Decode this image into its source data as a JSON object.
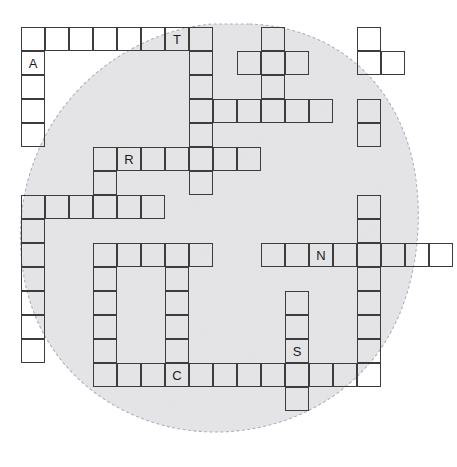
{
  "puzzle": {
    "title": "Crossword Grid",
    "cell_size": 24,
    "origin_x": 21,
    "origin_y": 27,
    "grid_stroke_color": "#3c3c3c",
    "letter_color": "#1a1a1a",
    "background_color": "#ffffff",
    "blob_fill_color": "#d9d9d9",
    "blob_outline_color": "#bdaec4",
    "letters": {
      "A": "A",
      "T": "T",
      "R": "R",
      "N": "N",
      "S": "S",
      "C": "C"
    },
    "entries": [
      {
        "name": "across-row0",
        "direction": "across",
        "row": 0,
        "col": 0,
        "length": 8,
        "cells": [
          {
            "col": 0,
            "letter": ""
          },
          {
            "col": 1,
            "letter": ""
          },
          {
            "col": 2,
            "letter": ""
          },
          {
            "col": 3,
            "letter": ""
          },
          {
            "col": 4,
            "letter": ""
          },
          {
            "col": 5,
            "letter": ""
          },
          {
            "col": 6,
            "letter": "T"
          },
          {
            "col": 7,
            "letter": ""
          }
        ]
      },
      {
        "name": "down-col0-top",
        "direction": "down",
        "row": 1,
        "col": 0,
        "length": 4,
        "cells": [
          {
            "row": 1,
            "letter": "A"
          },
          {
            "row": 2,
            "letter": ""
          },
          {
            "row": 3,
            "letter": ""
          },
          {
            "row": 4,
            "letter": ""
          }
        ]
      },
      {
        "name": "down-col7-upper",
        "direction": "down",
        "row": 1,
        "col": 7,
        "length": 6,
        "cells": [
          {
            "row": 1,
            "letter": ""
          },
          {
            "row": 2,
            "letter": ""
          },
          {
            "row": 3,
            "letter": ""
          },
          {
            "row": 4,
            "letter": ""
          },
          {
            "row": 5,
            "letter": ""
          },
          {
            "row": 6,
            "letter": ""
          }
        ]
      },
      {
        "name": "down-col10-upper",
        "direction": "down",
        "row": 0,
        "col": 10,
        "length": 4,
        "cells": [
          {
            "row": 0,
            "letter": ""
          },
          {
            "row": 1,
            "letter": ""
          },
          {
            "row": 2,
            "letter": ""
          },
          {
            "row": 3,
            "letter": ""
          }
        ]
      },
      {
        "name": "down-col14-upper",
        "direction": "down",
        "row": 0,
        "col": 14,
        "length": 2,
        "cells": [
          {
            "row": 0,
            "letter": ""
          },
          {
            "row": 1,
            "letter": ""
          }
        ]
      },
      {
        "name": "across-row1-right",
        "direction": "across",
        "row": 1,
        "col": 9,
        "length": 3,
        "cells": [
          {
            "col": 9,
            "letter": ""
          },
          {
            "col": 10,
            "letter": ""
          },
          {
            "col": 11,
            "letter": ""
          }
        ]
      },
      {
        "name": "across-row1-farright",
        "direction": "across",
        "row": 1,
        "col": 14,
        "length": 2,
        "cells": [
          {
            "col": 14,
            "letter": ""
          },
          {
            "col": 15,
            "letter": ""
          }
        ]
      },
      {
        "name": "across-row3-mid",
        "direction": "across",
        "row": 3,
        "col": 8,
        "length": 5,
        "cells": [
          {
            "col": 8,
            "letter": ""
          },
          {
            "col": 9,
            "letter": ""
          },
          {
            "col": 10,
            "letter": ""
          },
          {
            "col": 11,
            "letter": ""
          },
          {
            "col": 12,
            "letter": ""
          }
        ]
      },
      {
        "name": "down-col14-second",
        "direction": "down",
        "row": 3,
        "col": 14,
        "length": 2,
        "cells": [
          {
            "row": 3,
            "letter": ""
          },
          {
            "row": 4,
            "letter": ""
          }
        ]
      },
      {
        "name": "across-row5-r",
        "direction": "across",
        "row": 5,
        "col": 3,
        "length": 7,
        "cells": [
          {
            "col": 3,
            "letter": ""
          },
          {
            "col": 4,
            "letter": "R"
          },
          {
            "col": 5,
            "letter": ""
          },
          {
            "col": 6,
            "letter": ""
          },
          {
            "col": 7,
            "letter": ""
          },
          {
            "col": 8,
            "letter": ""
          },
          {
            "col": 9,
            "letter": ""
          }
        ]
      },
      {
        "name": "down-col3-mid",
        "direction": "down",
        "row": 6,
        "col": 3,
        "length": 2,
        "cells": [
          {
            "row": 6,
            "letter": ""
          },
          {
            "row": 7,
            "letter": ""
          }
        ]
      },
      {
        "name": "across-row7-left",
        "direction": "across",
        "row": 7,
        "col": 0,
        "length": 6,
        "cells": [
          {
            "col": 0,
            "letter": ""
          },
          {
            "col": 1,
            "letter": ""
          },
          {
            "col": 2,
            "letter": ""
          },
          {
            "col": 3,
            "letter": ""
          },
          {
            "col": 4,
            "letter": ""
          },
          {
            "col": 5,
            "letter": ""
          }
        ]
      },
      {
        "name": "down-col0-lower",
        "direction": "down",
        "row": 8,
        "col": 0,
        "length": 6,
        "cells": [
          {
            "row": 8,
            "letter": ""
          },
          {
            "row": 9,
            "letter": ""
          },
          {
            "row": 10,
            "letter": ""
          },
          {
            "row": 11,
            "letter": ""
          },
          {
            "row": 12,
            "letter": ""
          },
          {
            "row": 13,
            "letter": ""
          }
        ]
      },
      {
        "name": "across-row9-mid",
        "direction": "across",
        "row": 9,
        "col": 3,
        "length": 5,
        "cells": [
          {
            "col": 3,
            "letter": ""
          },
          {
            "col": 4,
            "letter": ""
          },
          {
            "col": 5,
            "letter": ""
          },
          {
            "col": 6,
            "letter": ""
          },
          {
            "col": 7,
            "letter": ""
          }
        ]
      },
      {
        "name": "down-col3-lower",
        "direction": "down",
        "row": 10,
        "col": 3,
        "length": 6,
        "cells": [
          {
            "row": 10,
            "letter": ""
          },
          {
            "row": 11,
            "letter": ""
          },
          {
            "row": 12,
            "letter": ""
          },
          {
            "row": 13,
            "letter": ""
          },
          {
            "row": 14,
            "letter": ""
          },
          {
            "row": 15,
            "letter": ""
          }
        ]
      },
      {
        "name": "down-col6-lower",
        "direction": "down",
        "row": 10,
        "col": 6,
        "length": 6,
        "cells": [
          {
            "row": 10,
            "letter": ""
          },
          {
            "row": 11,
            "letter": ""
          },
          {
            "row": 12,
            "letter": ""
          },
          {
            "row": 13,
            "letter": ""
          },
          {
            "row": 14,
            "letter": ""
          },
          {
            "row": 15,
            "letter": ""
          }
        ]
      },
      {
        "name": "across-row9-n",
        "direction": "across",
        "row": 9,
        "col": 10,
        "length": 8,
        "cells": [
          {
            "col": 10,
            "letter": ""
          },
          {
            "col": 11,
            "letter": ""
          },
          {
            "col": 12,
            "letter": "N"
          },
          {
            "col": 13,
            "letter": ""
          },
          {
            "col": 14,
            "letter": ""
          },
          {
            "col": 15,
            "letter": ""
          },
          {
            "col": 16,
            "letter": ""
          },
          {
            "col": 17,
            "letter": ""
          }
        ]
      },
      {
        "name": "down-col14-long",
        "direction": "down",
        "row": 7,
        "col": 14,
        "length": 9,
        "cells": [
          {
            "row": 7,
            "letter": ""
          },
          {
            "row": 8,
            "letter": ""
          },
          {
            "row": 9,
            "letter": ""
          },
          {
            "row": 10,
            "letter": ""
          },
          {
            "row": 11,
            "letter": ""
          },
          {
            "row": 12,
            "letter": ""
          },
          {
            "row": 13,
            "letter": ""
          },
          {
            "row": 14,
            "letter": ""
          },
          {
            "row": 15,
            "letter": ""
          }
        ]
      },
      {
        "name": "down-col11-s",
        "direction": "down",
        "row": 11,
        "col": 11,
        "length": 6,
        "cells": [
          {
            "row": 11,
            "letter": ""
          },
          {
            "row": 12,
            "letter": ""
          },
          {
            "row": 13,
            "letter": "S"
          },
          {
            "row": 14,
            "letter": ""
          },
          {
            "row": 15,
            "letter": ""
          },
          {
            "row": 16,
            "letter": ""
          }
        ]
      },
      {
        "name": "across-row14-c",
        "direction": "across",
        "row": 14,
        "col": 4,
        "length": 11,
        "cells": [
          {
            "col": 4,
            "letter": ""
          },
          {
            "col": 5,
            "letter": ""
          },
          {
            "col": 6,
            "letter": "C"
          },
          {
            "col": 7,
            "letter": ""
          },
          {
            "col": 8,
            "letter": ""
          },
          {
            "col": 9,
            "letter": ""
          },
          {
            "col": 10,
            "letter": ""
          },
          {
            "col": 11,
            "letter": ""
          },
          {
            "col": 12,
            "letter": ""
          },
          {
            "col": 13,
            "letter": ""
          },
          {
            "col": 14,
            "letter": ""
          }
        ]
      }
    ],
    "cells": [
      {
        "r": 0,
        "c": 0,
        "l": ""
      },
      {
        "r": 0,
        "c": 1,
        "l": ""
      },
      {
        "r": 0,
        "c": 2,
        "l": ""
      },
      {
        "r": 0,
        "c": 3,
        "l": ""
      },
      {
        "r": 0,
        "c": 4,
        "l": ""
      },
      {
        "r": 0,
        "c": 5,
        "l": ""
      },
      {
        "r": 0,
        "c": 6,
        "l": "T"
      },
      {
        "r": 0,
        "c": 7,
        "l": ""
      },
      {
        "r": 0,
        "c": 10,
        "l": ""
      },
      {
        "r": 0,
        "c": 14,
        "l": ""
      },
      {
        "r": 1,
        "c": 0,
        "l": "A"
      },
      {
        "r": 1,
        "c": 7,
        "l": ""
      },
      {
        "r": 1,
        "c": 9,
        "l": ""
      },
      {
        "r": 1,
        "c": 10,
        "l": ""
      },
      {
        "r": 1,
        "c": 11,
        "l": ""
      },
      {
        "r": 1,
        "c": 14,
        "l": ""
      },
      {
        "r": 1,
        "c": 15,
        "l": ""
      },
      {
        "r": 2,
        "c": 0,
        "l": ""
      },
      {
        "r": 2,
        "c": 7,
        "l": ""
      },
      {
        "r": 2,
        "c": 10,
        "l": ""
      },
      {
        "r": 3,
        "c": 0,
        "l": ""
      },
      {
        "r": 3,
        "c": 7,
        "l": ""
      },
      {
        "r": 3,
        "c": 8,
        "l": ""
      },
      {
        "r": 3,
        "c": 9,
        "l": ""
      },
      {
        "r": 3,
        "c": 10,
        "l": ""
      },
      {
        "r": 3,
        "c": 11,
        "l": ""
      },
      {
        "r": 3,
        "c": 12,
        "l": ""
      },
      {
        "r": 3,
        "c": 14,
        "l": ""
      },
      {
        "r": 4,
        "c": 0,
        "l": ""
      },
      {
        "r": 4,
        "c": 7,
        "l": ""
      },
      {
        "r": 4,
        "c": 14,
        "l": ""
      },
      {
        "r": 5,
        "c": 3,
        "l": ""
      },
      {
        "r": 5,
        "c": 4,
        "l": "R"
      },
      {
        "r": 5,
        "c": 5,
        "l": ""
      },
      {
        "r": 5,
        "c": 6,
        "l": ""
      },
      {
        "r": 5,
        "c": 7,
        "l": ""
      },
      {
        "r": 5,
        "c": 8,
        "l": ""
      },
      {
        "r": 5,
        "c": 9,
        "l": ""
      },
      {
        "r": 6,
        "c": 3,
        "l": ""
      },
      {
        "r": 6,
        "c": 7,
        "l": ""
      },
      {
        "r": 7,
        "c": 0,
        "l": ""
      },
      {
        "r": 7,
        "c": 1,
        "l": ""
      },
      {
        "r": 7,
        "c": 2,
        "l": ""
      },
      {
        "r": 7,
        "c": 3,
        "l": ""
      },
      {
        "r": 7,
        "c": 4,
        "l": ""
      },
      {
        "r": 7,
        "c": 5,
        "l": ""
      },
      {
        "r": 7,
        "c": 14,
        "l": ""
      },
      {
        "r": 8,
        "c": 0,
        "l": ""
      },
      {
        "r": 8,
        "c": 14,
        "l": ""
      },
      {
        "r": 9,
        "c": 0,
        "l": ""
      },
      {
        "r": 9,
        "c": 3,
        "l": ""
      },
      {
        "r": 9,
        "c": 4,
        "l": ""
      },
      {
        "r": 9,
        "c": 5,
        "l": ""
      },
      {
        "r": 9,
        "c": 6,
        "l": ""
      },
      {
        "r": 9,
        "c": 7,
        "l": ""
      },
      {
        "r": 9,
        "c": 10,
        "l": ""
      },
      {
        "r": 9,
        "c": 11,
        "l": ""
      },
      {
        "r": 9,
        "c": 12,
        "l": "N"
      },
      {
        "r": 9,
        "c": 13,
        "l": ""
      },
      {
        "r": 9,
        "c": 14,
        "l": ""
      },
      {
        "r": 9,
        "c": 15,
        "l": ""
      },
      {
        "r": 9,
        "c": 16,
        "l": ""
      },
      {
        "r": 9,
        "c": 17,
        "l": ""
      },
      {
        "r": 10,
        "c": 0,
        "l": ""
      },
      {
        "r": 10,
        "c": 3,
        "l": ""
      },
      {
        "r": 10,
        "c": 6,
        "l": ""
      },
      {
        "r": 10,
        "c": 14,
        "l": ""
      },
      {
        "r": 11,
        "c": 0,
        "l": ""
      },
      {
        "r": 11,
        "c": 3,
        "l": ""
      },
      {
        "r": 11,
        "c": 6,
        "l": ""
      },
      {
        "r": 11,
        "c": 11,
        "l": ""
      },
      {
        "r": 11,
        "c": 14,
        "l": ""
      },
      {
        "r": 12,
        "c": 0,
        "l": ""
      },
      {
        "r": 12,
        "c": 3,
        "l": ""
      },
      {
        "r": 12,
        "c": 6,
        "l": ""
      },
      {
        "r": 12,
        "c": 11,
        "l": ""
      },
      {
        "r": 12,
        "c": 14,
        "l": ""
      },
      {
        "r": 13,
        "c": 0,
        "l": ""
      },
      {
        "r": 13,
        "c": 3,
        "l": ""
      },
      {
        "r": 13,
        "c": 6,
        "l": ""
      },
      {
        "r": 13,
        "c": 11,
        "l": "S"
      },
      {
        "r": 13,
        "c": 14,
        "l": ""
      },
      {
        "r": 14,
        "c": 3,
        "l": ""
      },
      {
        "r": 14,
        "c": 4,
        "l": ""
      },
      {
        "r": 14,
        "c": 5,
        "l": ""
      },
      {
        "r": 14,
        "c": 6,
        "l": "C"
      },
      {
        "r": 14,
        "c": 7,
        "l": ""
      },
      {
        "r": 14,
        "c": 8,
        "l": ""
      },
      {
        "r": 14,
        "c": 9,
        "l": ""
      },
      {
        "r": 14,
        "c": 10,
        "l": ""
      },
      {
        "r": 14,
        "c": 11,
        "l": ""
      },
      {
        "r": 14,
        "c": 12,
        "l": ""
      },
      {
        "r": 14,
        "c": 13,
        "l": ""
      },
      {
        "r": 14,
        "c": 14,
        "l": ""
      },
      {
        "r": 15,
        "c": 11,
        "l": ""
      }
    ]
  }
}
